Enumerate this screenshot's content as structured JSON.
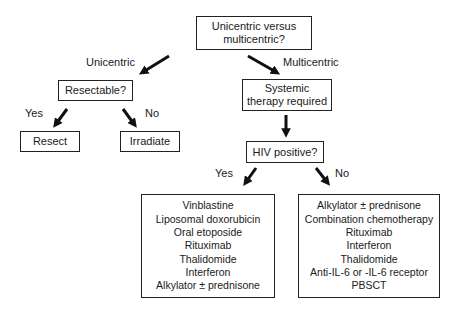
{
  "diagram": {
    "root": {
      "line1": "Unicentric versus",
      "line2": "multicentric?"
    },
    "branches": {
      "unicentric_label": "Unicentric",
      "multicentric_label": "Multicentric"
    },
    "resectable": {
      "question": "Resectable?",
      "yes_label": "Yes",
      "no_label": "No",
      "yes_outcome": "Resect",
      "no_outcome": "Irradiate"
    },
    "systemic": {
      "line1": "Systemic",
      "line2": "therapy required"
    },
    "hiv": {
      "question": "HIV positive?",
      "yes_label": "Yes",
      "no_label": "No",
      "yes_treatments": [
        "Vinblastine",
        "Liposomal doxorubicin",
        "Oral etoposide",
        "Rituximab",
        "Thalidomide",
        "Interferon",
        "Alkylator ± prednisone"
      ],
      "no_treatments": [
        "Alkylator ± prednisone",
        "Combination chemotherapy",
        "Rituximab",
        "Interferon",
        "Thalidomide",
        "Anti-IL-6 or -IL-6 receptor",
        "PBSCT"
      ]
    }
  }
}
